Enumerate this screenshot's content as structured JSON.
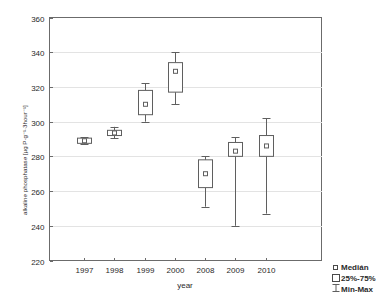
{
  "chart_data": {
    "type": "box",
    "title": "",
    "xlabel": "year",
    "ylabel": "alkaline phosphatase [µg P·g⁻¹·3hour⁻¹]",
    "categories": [
      "1997",
      "1998",
      "1999",
      "2000",
      "2008",
      "2009",
      "2010"
    ],
    "ylim": [
      220,
      360
    ],
    "yticks": [
      220,
      240,
      260,
      280,
      300,
      320,
      340,
      360
    ],
    "grid": true,
    "legend_position": "bottom-right",
    "boxes": [
      {
        "category": "1997",
        "min": 287.0,
        "q1": 287.5,
        "median": 289.0,
        "q3": 290.5,
        "max": 291.0
      },
      {
        "category": "1998",
        "min": 290.5,
        "q1": 292.0,
        "median": 293.5,
        "q3": 295.0,
        "max": 297.0
      },
      {
        "category": "1999",
        "min": 300.0,
        "q1": 304.0,
        "median": 310.0,
        "q3": 318.0,
        "max": 322.0
      },
      {
        "category": "2000",
        "min": 310.0,
        "q1": 317.0,
        "median": 329.0,
        "q3": 334.0,
        "max": 340.0
      },
      {
        "category": "2008",
        "min": 251.0,
        "q1": 262.0,
        "median": 270.0,
        "q3": 278.0,
        "max": 280.0
      },
      {
        "category": "2009",
        "min": 240.0,
        "q1": 280.0,
        "median": 283.0,
        "q3": 288.0,
        "max": 291.0
      },
      {
        "category": "2010",
        "min": 247.0,
        "q1": 280.0,
        "median": 286.0,
        "q3": 292.0,
        "max": 302.0
      }
    ]
  },
  "legend": {
    "items": [
      {
        "label": "Medián",
        "glyph": "median-square-small"
      },
      {
        "label": "25%-75%",
        "glyph": "box-square"
      },
      {
        "label": "Min-Max",
        "glyph": "whisker-bar"
      }
    ]
  },
  "axes": {
    "y_tick_labels": [
      "360",
      "340",
      "320",
      "300",
      "280",
      "260",
      "240",
      "220"
    ],
    "x_tick_labels": [
      "1997",
      "1998",
      "1999",
      "2000",
      "2008",
      "2009",
      "2010"
    ],
    "x_axis_title": "year",
    "y_axis_title": "alkaline phosphatase [µg P·g⁻¹·3hour⁻¹]"
  }
}
